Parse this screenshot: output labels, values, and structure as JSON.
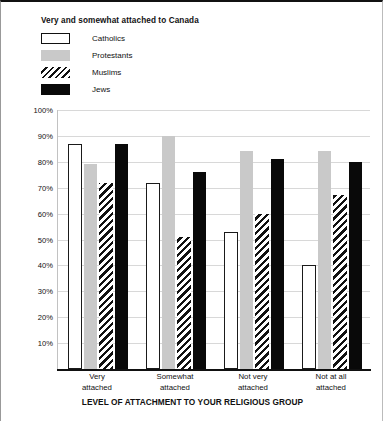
{
  "chart_data": {
    "type": "bar",
    "title": "Very and somewhat attached to Canada",
    "xlabel": "LEVEL OF ATTACHMENT TO YOUR RELIGIOUS GROUP",
    "ylabel": "",
    "categories": [
      "Very attached",
      "Somewhat attached",
      "Not very attached",
      "Not at all attached"
    ],
    "series": [
      {
        "name": "Catholics",
        "values": [
          87,
          72,
          53,
          40
        ],
        "color": "#ffffff",
        "pattern": "outline"
      },
      {
        "name": "Protestants",
        "values": [
          79,
          90,
          84,
          84
        ],
        "color": "#c9c9c9",
        "pattern": "solid"
      },
      {
        "name": "Muslims",
        "values": [
          72,
          51,
          60,
          67
        ],
        "color": "#111111",
        "pattern": "diagonal-hatch"
      },
      {
        "name": "Jews",
        "values": [
          87,
          76,
          81,
          80
        ],
        "color": "#090909",
        "pattern": "solid"
      }
    ],
    "ylim": [
      0,
      100
    ],
    "yticks": [
      "10%",
      "20%",
      "30%",
      "40%",
      "50%",
      "60%",
      "70%",
      "80%",
      "90%",
      "100%"
    ],
    "ytick_values": [
      10,
      20,
      30,
      40,
      50,
      60,
      70,
      80,
      90,
      100
    ],
    "grid": true,
    "legend_position": "top-left"
  },
  "legend": {
    "items": [
      {
        "label": "Catholics"
      },
      {
        "label": "Protestants"
      },
      {
        "label": "Muslims"
      },
      {
        "label": "Jews"
      }
    ]
  },
  "xlabels_wrapped": [
    "Very\nattached",
    "Somewhat\nattached",
    "Not very\nattached",
    "Not at all\nattached"
  ]
}
